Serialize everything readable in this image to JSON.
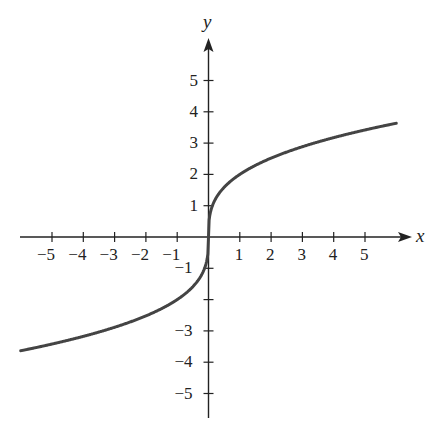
{
  "chart_data": {
    "type": "line",
    "title": "",
    "xlabel": "x",
    "ylabel": "y",
    "function": "y = 2·∛x",
    "xlim": [
      -6,
      6
    ],
    "ylim": [
      -6,
      6
    ],
    "grid": false,
    "x_ticks": [
      -5,
      -4,
      -3,
      -2,
      -1,
      1,
      2,
      3,
      4,
      5
    ],
    "x_tick_labels": [
      "−5",
      "−4",
      "−3",
      "−2",
      "−1",
      "1",
      "2",
      "3",
      "4",
      "5"
    ],
    "y_ticks": [
      -5,
      -4,
      -3,
      -2,
      -1,
      1,
      2,
      3,
      4,
      5
    ],
    "y_tick_labels": [
      "−5",
      "−4",
      "−3",
      "",
      "−1",
      "1",
      "2",
      "3",
      "4",
      "5"
    ],
    "series": [
      {
        "name": "curve",
        "x": [
          -6,
          -5,
          -4,
          -3,
          -2,
          -1,
          -0.5,
          -0.1,
          0,
          0.1,
          0.5,
          1,
          2,
          3,
          4,
          5,
          6
        ],
        "y": [
          -3.63,
          -3.42,
          -3.17,
          -2.88,
          -2.52,
          -2.0,
          -1.59,
          -0.93,
          0,
          0.93,
          1.59,
          2.0,
          2.52,
          2.88,
          3.17,
          3.42,
          3.63
        ]
      }
    ]
  },
  "labels": {
    "x_axis": "x",
    "y_axis": "y"
  },
  "colors": {
    "curve": "#444444",
    "axis": "#222222"
  }
}
